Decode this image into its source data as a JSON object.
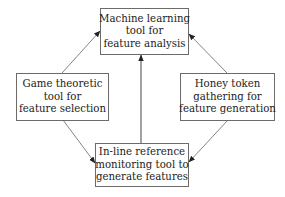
{
  "diagram": {
    "nodes": {
      "top": {
        "lines": [
          "Machine learning",
          "tool for",
          "feature analysis"
        ]
      },
      "left": {
        "lines": [
          "Game theoretic",
          "tool for",
          "feature selection"
        ]
      },
      "right": {
        "lines": [
          "Honey token",
          "gathering for",
          "feature generation"
        ]
      },
      "bottom": {
        "lines": [
          "In-line reference",
          "monitoring tool to",
          "generate features"
        ]
      }
    },
    "edges": [
      {
        "from": "left",
        "to": "top"
      },
      {
        "from": "right",
        "to": "top"
      },
      {
        "from": "bottom",
        "to": "top"
      },
      {
        "from": "left",
        "to": "bottom"
      },
      {
        "from": "right",
        "to": "bottom"
      }
    ],
    "colors": {
      "line": "#555555",
      "border": "#6b6b6b",
      "text": "#222222"
    }
  }
}
